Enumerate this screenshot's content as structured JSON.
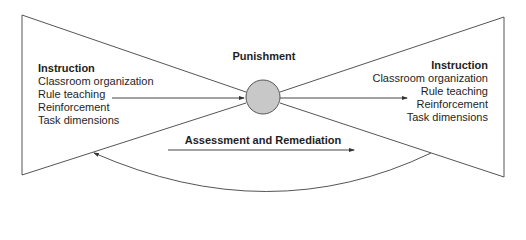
{
  "diagram": {
    "center_node": {
      "label": "Punishment",
      "shape": "circle",
      "fill": "#c8c8c8",
      "stroke": "#555555"
    },
    "left_panel": {
      "title": "Instruction",
      "items": [
        "Classroom organization",
        "Rule teaching",
        "Reinforcement",
        "Task dimensions"
      ]
    },
    "right_panel": {
      "title": "Instruction",
      "items": [
        "Classroom organization",
        "Rule teaching",
        "Reinforcement",
        "Task dimensions"
      ]
    },
    "bottom_arrow": {
      "label": "Assessment and Remediation"
    },
    "colors": {
      "line": "#555555",
      "text": "#1e1e1e",
      "circle_fill": "#c8c8c8",
      "background": "#ffffff"
    }
  }
}
